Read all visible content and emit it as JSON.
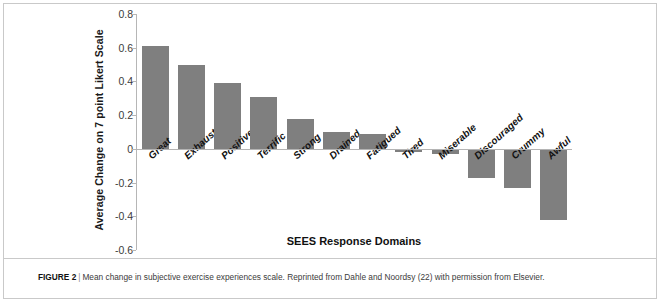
{
  "figure": {
    "label": "FIGURE 2",
    "separator": "|",
    "caption": "Mean change in subjective exercise experiences scale. Reprinted from Dahle and Noordsy (22) with permission from Elsevier."
  },
  "chart_data": {
    "type": "bar",
    "title": "",
    "xlabel": "SEES Response Domains",
    "ylabel": "Average Change on 7 point Likert Scale",
    "categories": [
      "Great",
      "Exhausted",
      "Positive",
      "Terrific",
      "Strong",
      "Drained",
      "Fatigued",
      "Tired",
      "Miserable",
      "Discouraged",
      "Crummy",
      "Awful"
    ],
    "values": [
      0.61,
      0.5,
      0.39,
      0.31,
      0.18,
      0.1,
      0.09,
      -0.02,
      -0.03,
      -0.17,
      -0.23,
      -0.42
    ],
    "ylim": [
      -0.6,
      0.8
    ],
    "yticks": [
      0.8,
      0.6,
      0.4,
      0.2,
      0,
      -0.2,
      -0.4,
      -0.6
    ],
    "ytick_labels": [
      "0.8",
      "0.6",
      "0.4",
      "0.2",
      "0",
      "-0.2",
      "-0.4",
      "-0.6"
    ],
    "grid": false,
    "legend": "none",
    "bar_color": "#7f7f7f",
    "axis_color": "#b4b4b4"
  }
}
